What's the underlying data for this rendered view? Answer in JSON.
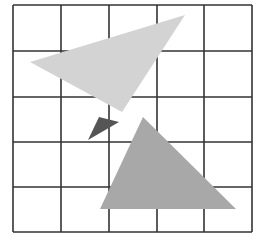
{
  "diagram": {
    "grid": {
      "rows": 5,
      "cols": 5,
      "x_lines": [
        13,
        61,
        109,
        157,
        204,
        252
      ],
      "y_lines": [
        5,
        51,
        97,
        142,
        187,
        232
      ],
      "line_color": "#333333"
    },
    "shapes": [
      {
        "name": "light-triangle",
        "points": "30,62 185,15 122,112",
        "fill": "#d3d3d3"
      },
      {
        "name": "dark-triangle",
        "points": "88,140 99,117 119,122",
        "fill": "#555555"
      },
      {
        "name": "medium-triangle",
        "points": "143,117 100,209 236,209",
        "fill": "#a8a8a8"
      }
    ]
  }
}
